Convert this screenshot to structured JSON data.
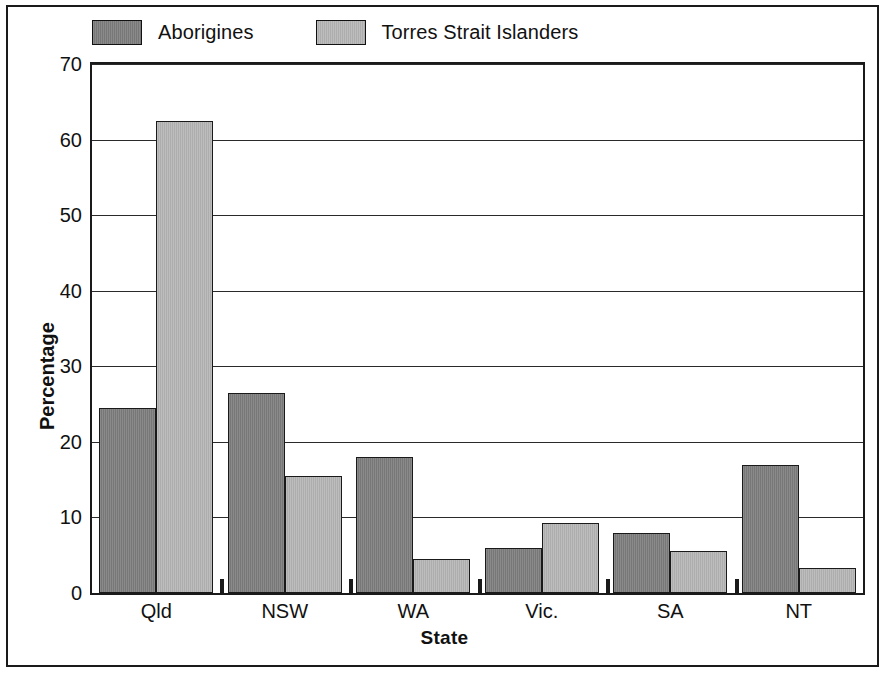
{
  "chart_data": {
    "type": "bar",
    "title": "",
    "xlabel": "State",
    "ylabel": "Percentage",
    "ylim": [
      0,
      70
    ],
    "yticks": [
      0,
      10,
      20,
      30,
      40,
      50,
      60,
      70
    ],
    "grid": true,
    "legend_position": "top-left",
    "categories": [
      "Qld",
      "NSW",
      "WA",
      "Vic.",
      "SA",
      "NT"
    ],
    "series": [
      {
        "name": "Aborigines",
        "color": "#7d7d7d",
        "values": [
          24.5,
          26.5,
          18.0,
          6.0,
          8.0,
          17.0
        ]
      },
      {
        "name": "Torres Strait Islanders",
        "color": "#b4b4b4",
        "values": [
          62.5,
          15.5,
          4.5,
          9.3,
          5.5,
          3.3
        ]
      }
    ]
  },
  "legend": {
    "entries": [
      {
        "label": "Aborigines",
        "swatch": "#7d7d7d"
      },
      {
        "label": "Torres Strait Islanders",
        "swatch": "#b4b4b4"
      }
    ]
  },
  "axes": {
    "y_title": "Percentage",
    "x_title": "State",
    "y_tick_labels": [
      "70",
      "60",
      "50",
      "40",
      "30",
      "20",
      "10",
      "0"
    ],
    "x_tick_labels": [
      "Qld",
      "NSW",
      "WA",
      "Vic.",
      "SA",
      "NT"
    ]
  },
  "colors": {
    "series_dark": "#7d7d7d",
    "series_light": "#b4b4b4",
    "frame": "#1a1a1a",
    "grid": "#2a2a2a",
    "background": "#ffffff",
    "text": "#111111"
  }
}
